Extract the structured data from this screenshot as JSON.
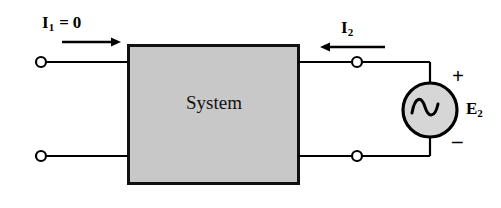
{
  "diagram": {
    "kind": "two-port-network-schematic",
    "background_color": "#ffffff",
    "line_color": "#000000",
    "block": {
      "label": "System",
      "fill_color": "#c8c8c8",
      "border_color": "#111111",
      "x": 128,
      "y": 45,
      "width": 170,
      "height": 138
    },
    "labels": {
      "i1_symbol": "I",
      "i1_subscript": "1",
      "i1_equals": "=",
      "i1_value": "0",
      "i2_symbol": "I",
      "i2_subscript": "2",
      "e2_symbol": "E",
      "e2_subscript": "2",
      "polarity_plus": "+",
      "polarity_minus": "–"
    },
    "source": {
      "type": "ac-voltage-source",
      "symbol": "sine-wave",
      "fill_color": "#d6d6d6",
      "center_x": 430,
      "center_y": 110,
      "radius": 28
    },
    "terminals": [
      {
        "name": "terminal-top-left",
        "x": 41,
        "y": 62
      },
      {
        "name": "terminal-bottom-left",
        "x": 41,
        "y": 156
      },
      {
        "name": "terminal-top-right",
        "x": 357,
        "y": 62
      },
      {
        "name": "terminal-bottom-right",
        "x": 357,
        "y": 156
      }
    ],
    "arrows": [
      {
        "name": "current-arrow-i1",
        "direction": "right",
        "x1": 62,
        "x2": 121,
        "y": 42
      },
      {
        "name": "current-arrow-i2",
        "direction": "left",
        "x1": 385,
        "x2": 320,
        "y": 47
      }
    ]
  }
}
